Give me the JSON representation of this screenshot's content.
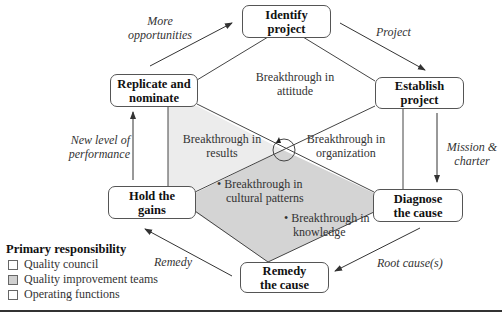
{
  "colors": {
    "results_region": "#ececec",
    "diamond_region": "#d4d4d4",
    "line": "#444444",
    "quality_council_swatch": "#ffffff",
    "qit_swatch": "#d0d0d0",
    "operating_swatch": "#ffffff"
  },
  "nodes": {
    "identify": "Identify project",
    "identify_l1": "Identify",
    "identify_l2": "project",
    "establish_l1": "Establish",
    "establish_l2": "project",
    "diagnose_l1": "Diagnose",
    "diagnose_l2": "the cause",
    "remedy_l1": "Remedy",
    "remedy_l2": "the cause",
    "hold_l1": "Hold the",
    "hold_l2": "gains",
    "replicate_l1": "Replicate and",
    "replicate_l2": "nominate"
  },
  "edges": {
    "more_opportunities_l1": "More",
    "more_opportunities_l2": "opportunities",
    "project": "Project",
    "mission_l1": "Mission &",
    "mission_l2": "charter",
    "root_cause": "Root cause(s)",
    "remedy": "Remedy",
    "new_level_l1": "New level of",
    "new_level_l2": "performance"
  },
  "regions": {
    "attitude_l1": "Breakthrough in",
    "attitude_l2": "attitude",
    "results_l1": "Breakthrough in",
    "results_l2": "results",
    "organization_l1": "Breakthrough in",
    "organization_l2": "organization",
    "cultural_l1": "• Breakthrough in",
    "cultural_l2": "cultural patterns",
    "knowledge_l1": "• Breakthrough in",
    "knowledge_l2": "knowledge"
  },
  "legend": {
    "title": "Primary responsibility",
    "items": [
      {
        "label": "Quality council"
      },
      {
        "label": "Quality improvement teams"
      },
      {
        "label": "Operating functions"
      }
    ]
  }
}
